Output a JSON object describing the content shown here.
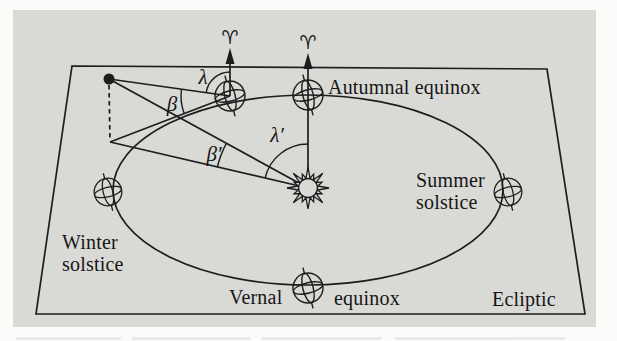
{
  "diagram": {
    "labels": {
      "autumnal_equinox": "Autumnal equinox",
      "summer_solstice": [
        "Summer",
        "solstice"
      ],
      "winter_solstice": [
        "Winter",
        "solstice"
      ],
      "vernal": "Vernal",
      "equinox": "equinox",
      "ecliptic": "Ecliptic"
    },
    "angles": {
      "lambda": "λ",
      "beta": "β",
      "lambda_prime": "λ′",
      "beta_prime": "β′"
    },
    "symbols": {
      "vernal_equinox_left": "♈",
      "vernal_equinox_right": "♈"
    },
    "colors": {
      "page_background": "#fbfbfa",
      "panel_background": "#d9dad6",
      "ink": "#1d1d1d"
    }
  }
}
